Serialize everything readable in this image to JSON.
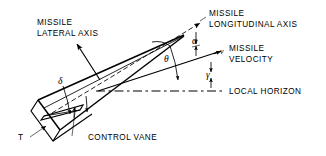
{
  "figure": {
    "background_color": "#ffffff",
    "line_color": "#000000",
    "width": 326,
    "height": 156
  },
  "labels": {
    "missile_lateral_axis_line1": "MISSILE",
    "missile_lateral_axis_line2": "LATERAL AXIS",
    "missile_longitudinal_axis_line1": "MISSILE",
    "missile_longitudinal_axis_line2": "LONGITUDINAL AXIS",
    "missile_velocity_line1": "MISSILE",
    "missile_velocity_line2": "VELOCITY",
    "local_horizon": "LOCAL HORIZON",
    "control_vane": "CONTROL VANE",
    "thrust": "T",
    "velocity_vector": "v"
  },
  "angles": {
    "alpha": "α",
    "alpha_name": "angle-of-attack",
    "gamma": "γ",
    "gamma_name": "flight-path-angle",
    "theta": "θ",
    "theta_name": "pitch-attitude-angle",
    "delta": "δ",
    "delta_name": "control-vane-deflection-angle"
  }
}
